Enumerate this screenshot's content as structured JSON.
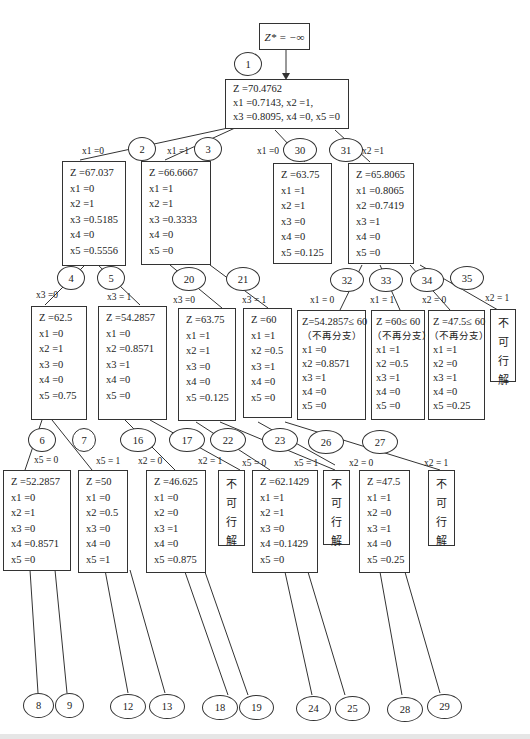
{
  "start": {
    "label": "Z* = −∞"
  },
  "root": {
    "node": "1",
    "lines": [
      "Z =70.4762",
      "x1 =0.7143,  x2 =1,",
      "x3 =0.8095,  x4 =0,  x5 =0"
    ]
  },
  "boxes": [
    {
      "id": "b2",
      "lines": [
        "Z =67.037",
        "x1 =0",
        "x2 =1",
        "x3 =0.5185",
        "x4 =0",
        "x5 =0.5556"
      ]
    },
    {
      "id": "b3",
      "lines": [
        "Z =66.6667",
        "x1 =1",
        "x2 =1",
        "x3 =0.3333",
        "x4 =0",
        "x5 =0"
      ]
    },
    {
      "id": "b30",
      "lines": [
        "Z =63.75",
        "x1 =1",
        "x2 =1",
        "x3 =0",
        "x4 =0",
        "x5 =0.125"
      ]
    },
    {
      "id": "b31",
      "lines": [
        "Z =65.8065",
        "x1 =0.8065",
        "x2 =0.7419",
        "x3 =1",
        "x4 =0",
        "x5 =0"
      ]
    },
    {
      "id": "b4",
      "lines": [
        "Z =62.5",
        "x1 =0",
        "x2 =1",
        "x3 =0",
        "x4 =0",
        "x5 =0.75"
      ]
    },
    {
      "id": "b5",
      "lines": [
        "Z =54.2857",
        "x1 =0",
        "x2 =0.8571",
        "x3 =1",
        "x4 =0",
        "x5 =0"
      ]
    },
    {
      "id": "b20",
      "lines": [
        "Z =63.75",
        "x1 =1",
        "x2 =1",
        "x3 =0",
        "x4 =0",
        "x5 =0.125"
      ]
    },
    {
      "id": "b21",
      "lines": [
        "Z =60",
        "x1 =1",
        "x2 =0.5",
        "x3 =1",
        "x4 =0",
        "x5 =0"
      ]
    },
    {
      "id": "b32",
      "lines": [
        "Z=54.2857≤ 60",
        "（不再分支）",
        "x1 =0",
        "x2 =0.8571",
        "x3 =1",
        "x4 =0",
        "x5 =0"
      ]
    },
    {
      "id": "b33",
      "lines": [
        "Z =60≤ 60",
        "（不再分支）",
        "x1 =1",
        "x2 =0.5",
        "x3 =1",
        "x4 =0",
        "x5 =0"
      ]
    },
    {
      "id": "b34",
      "lines": [
        "Z =47.5≤ 60",
        "（不再分支）",
        "x1 =1",
        "x2 =0",
        "x3 =1",
        "x4 =0",
        "x5 =0.25"
      ]
    },
    {
      "id": "b6",
      "lines": [
        "Z =52.2857",
        "x1 =0",
        "x2 =1",
        "x3 =0",
        "x4 =0.8571",
        "x5 =0"
      ]
    },
    {
      "id": "b7",
      "lines": [
        "Z =50",
        "x1 =0",
        "x2 =0.5",
        "x3 =0",
        "x4 =0",
        "x5 =1"
      ]
    },
    {
      "id": "b16",
      "lines": [
        "Z =46.625",
        "x1 =0",
        "x2 =0",
        "x3 =1",
        "x4 =0",
        "x5 =0.875"
      ]
    },
    {
      "id": "b22",
      "lines": [
        "Z =62.1429",
        "x1 =1",
        "x2 =1",
        "x3 =0",
        "x4 =0.1429",
        "x5 =0"
      ]
    },
    {
      "id": "b26",
      "lines": [
        "Z =47.5",
        "x1 =1",
        "x2 =0",
        "x3 =1",
        "x4 =0",
        "x5 =0.25"
      ]
    }
  ],
  "infeasible_label": [
    "不",
    "可",
    "行",
    "解"
  ],
  "nodes": [
    "1",
    "2",
    "3",
    "30",
    "31",
    "4",
    "5",
    "20",
    "21",
    "32",
    "33",
    "34",
    "35",
    "6",
    "7",
    "16",
    "17",
    "22",
    "23",
    "26",
    "27",
    "8",
    "9",
    "12",
    "13",
    "18",
    "19",
    "24",
    "25",
    "28",
    "29"
  ],
  "edge_labels": {
    "e2": "x1 =0",
    "e3": "x1 =1",
    "e30": "x1 =0",
    "e31": "x2 =1",
    "e4": "x3 =0",
    "e5": "x3 = 1",
    "e20": "x3 =0",
    "e21": "x3 = 1",
    "e32": "x1 = 0",
    "e33": "x1 = 1",
    "e34": "x2 = 0",
    "e35": "x2 = 1",
    "e6": "x5 = 0",
    "e7": "x5 = 1",
    "e16": "x2 = 0",
    "e17": "x2 = 1",
    "e22": "x5 = 0",
    "e23": "x5 = 1",
    "e26": "x2 = 0",
    "e27": "x2 = 1"
  }
}
